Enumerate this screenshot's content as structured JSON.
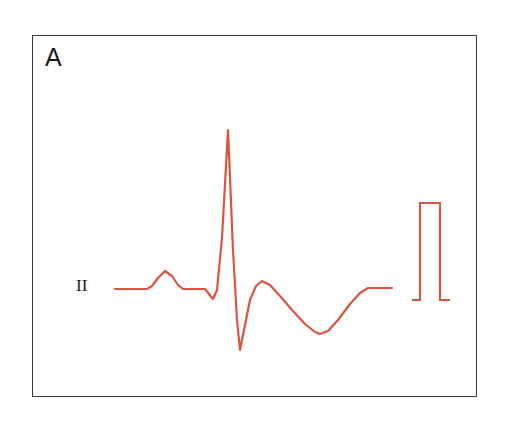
{
  "figure": {
    "panel_label": "A",
    "lead_label": "II",
    "background_color": "#ffffff",
    "frame_color": "#3a3a3a",
    "trace_color": "#d9553f",
    "label_color": "#1a1a1a"
  },
  "chart_data": {
    "type": "line",
    "title": "A",
    "xlabel": "",
    "ylabel": "",
    "legend": [
      "II"
    ],
    "legend_position": "left-inline",
    "grid": false,
    "axis_visible": false,
    "xlim": [
      32,
      477
    ],
    "ylim": [
      35,
      397
    ],
    "baseline_y": 289,
    "annotations": [
      {
        "name": "panel-letter",
        "text": "A",
        "x": 45,
        "y": 57
      },
      {
        "name": "lead-name",
        "text": "II",
        "x": 76,
        "y": 289
      }
    ],
    "series": [
      {
        "name": "ecg-lead-II-beat",
        "color": "#d9553f",
        "line_width": 2.2,
        "units": {
          "x": "time",
          "y": "amplitude"
        },
        "features": [
          {
            "wave": "baseline-start",
            "x_range": [
              115,
              147
            ],
            "y": 289
          },
          {
            "wave": "P",
            "peak_x": 165,
            "peak_y": 271,
            "onset_x": 147,
            "offset_x": 183
          },
          {
            "wave": "PR-segment",
            "x_range": [
              183,
              205
            ],
            "y": 289
          },
          {
            "wave": "Q",
            "trough_x": 213,
            "trough_y": 299
          },
          {
            "wave": "R",
            "peak_x": 228,
            "peak_y": 130
          },
          {
            "wave": "S",
            "trough_x": 240,
            "trough_y": 350
          },
          {
            "wave": "J-hump",
            "peak_x": 262,
            "peak_y": 281
          },
          {
            "wave": "T-inverted",
            "trough_x": 320,
            "trough_y": 334
          },
          {
            "wave": "baseline-end",
            "x_range": [
              368,
              392
            ],
            "y": 288
          }
        ],
        "points": [
          [
            115,
            289
          ],
          [
            147,
            289
          ],
          [
            152,
            286
          ],
          [
            158,
            278
          ],
          [
            165,
            271
          ],
          [
            172,
            276
          ],
          [
            178,
            285
          ],
          [
            183,
            289
          ],
          [
            205,
            289
          ],
          [
            209,
            294
          ],
          [
            213,
            299
          ],
          [
            217,
            290
          ],
          [
            222,
            238
          ],
          [
            228,
            130
          ],
          [
            233,
            250
          ],
          [
            237,
            320
          ],
          [
            240,
            350
          ],
          [
            244,
            330
          ],
          [
            250,
            300
          ],
          [
            256,
            286
          ],
          [
            262,
            281
          ],
          [
            270,
            285
          ],
          [
            280,
            296
          ],
          [
            292,
            310
          ],
          [
            305,
            324
          ],
          [
            315,
            332
          ],
          [
            320,
            334
          ],
          [
            328,
            331
          ],
          [
            338,
            320
          ],
          [
            350,
            304
          ],
          [
            360,
            293
          ],
          [
            368,
            288
          ],
          [
            380,
            288
          ],
          [
            392,
            288
          ]
        ]
      },
      {
        "name": "calibration-pulse",
        "color": "#d9553f",
        "line_width": 2.2,
        "description": "1 mV rectangular calibration step",
        "points": [
          [
            412,
            300
          ],
          [
            420,
            300
          ],
          [
            420,
            203
          ],
          [
            440,
            203
          ],
          [
            440,
            300
          ],
          [
            450,
            300
          ]
        ]
      }
    ]
  }
}
